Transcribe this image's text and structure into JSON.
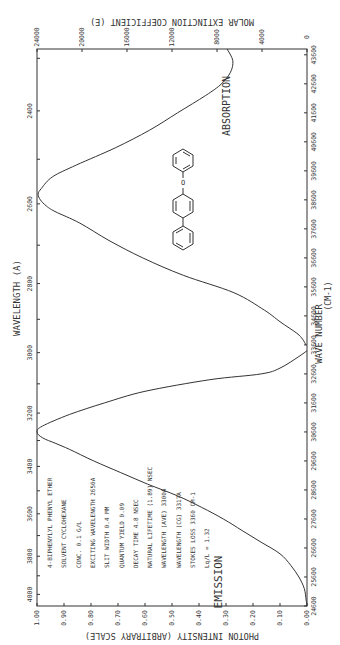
{
  "chart_data": {
    "type": "line",
    "orientation": "rotated 90 degrees clockwise (x-axis vertical, text reads bottom-to-top)",
    "title": "4-BIPHENYLYL PHENYL ETHER",
    "x_axis_primary": {
      "label": "WAVE NUMBER (CM-1)",
      "ticks": [
        24600,
        25600,
        26600,
        27600,
        28600,
        29600,
        30600,
        31600,
        32600,
        33600,
        34600,
        35600,
        36600,
        37600,
        38600,
        39600,
        40600,
        41600,
        42600,
        43600
      ],
      "range": [
        24600,
        43800
      ]
    },
    "x_axis_secondary": {
      "label": "WAVELENGTH (A)",
      "ticks": [
        2400,
        2600,
        2800,
        3000,
        3200,
        3400,
        3600,
        3800,
        4000
      ]
    },
    "y_axis_left": {
      "label": "PHOTON INTENSITY (ARBITRARY SCALE)",
      "ticks": [
        "0.00",
        "0.10",
        "0.20",
        "0.30",
        "0.40",
        "0.50",
        "0.60",
        "0.70",
        "0.80",
        "0.90",
        "1.00"
      ],
      "range": [
        0,
        1
      ]
    },
    "y_axis_right": {
      "label": "MOLAR EXTINCTION COEFFICIENT (E)",
      "ticks": [
        "0",
        "4000",
        "8000",
        "12000",
        "16000",
        "20000",
        "24000"
      ],
      "range": [
        0,
        24000
      ]
    },
    "series": [
      {
        "name": "ABSORPTION",
        "axis": "molar_extinction",
        "wavenumber": [
          43800,
          43400,
          43000,
          42600,
          42200,
          41600,
          41000,
          40400,
          39800,
          39400,
          39000,
          38800,
          38600,
          38400,
          38200,
          37800,
          37200,
          36600,
          36000,
          35400,
          34800,
          34400,
          34000,
          33800,
          33600
        ],
        "values": [
          7100,
          6600,
          6800,
          7600,
          9000,
          11500,
          14000,
          17000,
          20500,
          22600,
          23600,
          23900,
          23700,
          23200,
          22400,
          20200,
          17600,
          14600,
          11000,
          6500,
          3800,
          2400,
          900,
          400,
          100
        ]
      },
      {
        "name": "EMISSION",
        "axis": "photon_intensity",
        "wavenumber": [
          33400,
          33200,
          32800,
          32600,
          32400,
          32000,
          31600,
          31200,
          30800,
          30600,
          30400,
          30200,
          30000,
          29600,
          29200,
          28800,
          28400,
          28000,
          27600,
          27200,
          26800,
          26400,
          26000,
          25600,
          25200,
          24800,
          24600
        ],
        "values": [
          0.0,
          0.03,
          0.1,
          0.17,
          0.36,
          0.6,
          0.75,
          0.88,
          0.98,
          1.0,
          0.98,
          0.93,
          0.88,
          0.79,
          0.69,
          0.59,
          0.48,
          0.39,
          0.31,
          0.24,
          0.17,
          0.1,
          0.06,
          0.03,
          0.01,
          0.003,
          0.0
        ]
      }
    ],
    "annotations": {
      "compound": "4-BIPHENYLYL PHENYL ETHER",
      "solvent": "SOLVENT  CYCLOHEXANE",
      "conc": "CONC.  0.1 G/L",
      "exciting_wavelength": "EXCITING WAVELENGTH  2650A",
      "slit_width": "SLIT WIDTH  0.4 MM",
      "quantum_yield": "QUANTUM YIELD  0.09",
      "decay_time": "DECAY TIME  4.8 NSEC",
      "natural_lifetime": "NATURAL LIFETIME  (1.89) NSEC",
      "wavelength_ave": "WAVELENGTH (AVE)  3300A",
      "wavelength_cg": "WAVELENGTH (CG)  3317A",
      "stokes_loss": "STOKES LOSS  3360 CM-1",
      "lq_l": "Lq/L = 1.32",
      "emission_label": "EMISSION",
      "absorption_label": "ABSORPTION"
    },
    "grid": false,
    "legend": "none (curves labeled inline)"
  },
  "labels": {
    "top_axis_title": "MOLAR EXTINCTION COEFFICIENT (E)",
    "bottom_axis_title": "PHOTON INTENSITY (ARBITRARY SCALE)",
    "wavelength_title": "WAVELENGTH    (A)",
    "wavenumber_title": "WAVE NUMBER",
    "wavenumber_unit": "(CM-1)",
    "absorption": "ABSORPTION",
    "emission": "EMISSION",
    "info_lines": [
      "4-BIPHENYLYL PHENYL ETHER",
      "SOLVENT  CYCLOHEXANE",
      "CONC.  0.1 G/L",
      "EXCITING WAVELENGTH  2650A",
      "SLIT WIDTH  0.4 MM",
      "QUANTUM YIELD  0.09",
      "DECAY TIME  4.8 NSEC",
      "NATURAL LIFETIME  (1.89) NSEC",
      "WAVELENGTH (AVE)  3300A",
      "WAVELENGTH (CG)  3317A",
      "STOKES LOSS  3360 CM-1",
      "Lq/L = 1.32"
    ]
  }
}
